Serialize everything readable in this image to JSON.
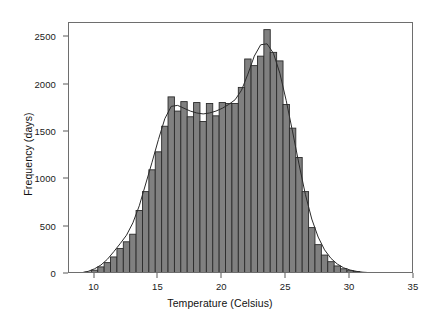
{
  "chart_data": {
    "type": "bar",
    "title": "",
    "subtitle": "",
    "xlabel": "Temperature (Celsius)",
    "ylabel": "Frequency (days)",
    "xlim": [
      8.0,
      35.0
    ],
    "ylim": [
      0,
      2650
    ],
    "grid": false,
    "legend": null,
    "bin_width": 0.5,
    "xticks": [
      10,
      15,
      20,
      25,
      30,
      35
    ],
    "xtick_labels": [
      "10",
      "15",
      "20",
      "25",
      "30",
      "35"
    ],
    "yticks": [
      0,
      500,
      1000,
      1500,
      2000,
      2500
    ],
    "ytick_labels": [
      "0",
      "500",
      "1000",
      "1500",
      "2000",
      "2500"
    ],
    "bar_fill_color": "#808080",
    "bar_edge_color": "#2b2b2b",
    "curve_color": "#2b2b2b",
    "axis_color": "#6e6e6e",
    "background_color": "#ffffff",
    "categories": [
      "8.5",
      "9.0",
      "9.5",
      "10.0",
      "10.5",
      "11.0",
      "11.5",
      "12.0",
      "12.5",
      "13.0",
      "13.5",
      "14.0",
      "14.5",
      "15.0",
      "15.5",
      "16.0",
      "16.5",
      "17.0",
      "17.5",
      "18.0",
      "18.5",
      "19.0",
      "19.5",
      "20.0",
      "20.5",
      "21.0",
      "21.5",
      "22.0",
      "22.5",
      "23.0",
      "23.5",
      "24.0",
      "24.5",
      "25.0",
      "25.5",
      "26.0",
      "26.5",
      "27.0",
      "27.5",
      "28.0",
      "28.5",
      "29.0",
      "29.5",
      "30.0",
      "30.5",
      "31.0",
      "31.5",
      "32.0",
      "32.5",
      "33.0",
      "33.5",
      "34.0"
    ],
    "values": [
      5,
      10,
      20,
      40,
      75,
      120,
      180,
      270,
      340,
      420,
      670,
      870,
      1100,
      1290,
      1560,
      1870,
      1720,
      1820,
      1660,
      1810,
      1610,
      1800,
      1670,
      1810,
      1800,
      1800,
      1970,
      2270,
      2200,
      2300,
      2580,
      2340,
      2250,
      1790,
      1540,
      1230,
      870,
      490,
      310,
      200,
      130,
      85,
      55,
      35,
      25,
      18,
      12,
      9,
      6,
      4,
      3,
      2
    ],
    "density_curve": {
      "description": "Smoothed bimodal kernel density overlay scaled to frequency",
      "x": [
        8.0,
        8.5,
        9.0,
        9.5,
        10.0,
        10.5,
        11.0,
        11.5,
        12.0,
        12.5,
        13.0,
        13.5,
        14.0,
        14.5,
        15.0,
        15.5,
        16.0,
        16.5,
        17.0,
        17.5,
        18.0,
        18.5,
        19.0,
        19.5,
        20.0,
        20.5,
        21.0,
        21.5,
        22.0,
        22.5,
        23.0,
        23.5,
        24.0,
        24.5,
        25.0,
        25.5,
        26.0,
        26.5,
        27.0,
        27.5,
        28.0,
        28.5,
        29.0,
        29.5,
        30.0,
        30.5,
        31.0,
        31.5,
        32.0,
        33.0,
        34.0,
        35.0
      ],
      "y": [
        2,
        6,
        14,
        28,
        55,
        95,
        155,
        235,
        320,
        410,
        540,
        720,
        950,
        1180,
        1420,
        1640,
        1770,
        1780,
        1750,
        1720,
        1700,
        1690,
        1700,
        1720,
        1750,
        1790,
        1840,
        1940,
        2110,
        2300,
        2420,
        2430,
        2330,
        2120,
        1830,
        1500,
        1160,
        840,
        580,
        390,
        255,
        165,
        105,
        65,
        42,
        28,
        18,
        12,
        8,
        4,
        2,
        1
      ]
    },
    "peaks": [
      {
        "x": 16.0,
        "y": 1870,
        "label": "left mode"
      },
      {
        "x": 23.5,
        "y": 2580,
        "label": "right mode (global max)"
      }
    ]
  }
}
